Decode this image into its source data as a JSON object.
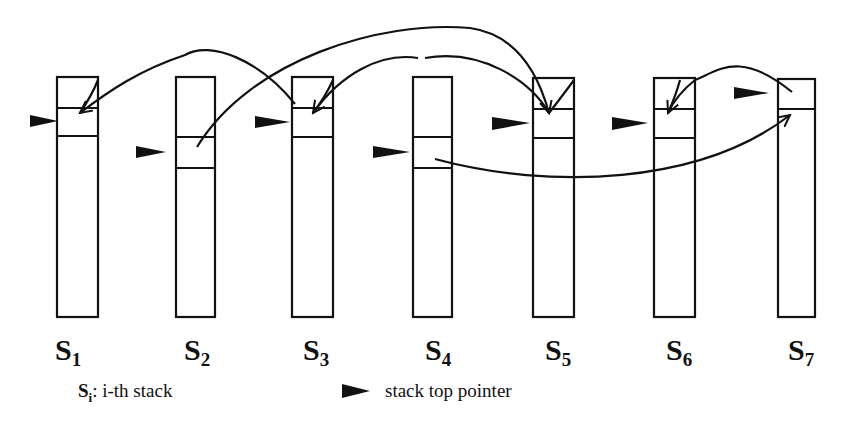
{
  "stacks": [
    {
      "name": "S",
      "index": "1"
    },
    {
      "name": "S",
      "index": "2"
    },
    {
      "name": "S",
      "index": "3"
    },
    {
      "name": "S",
      "index": "4"
    },
    {
      "name": "S",
      "index": "5"
    },
    {
      "name": "S",
      "index": "6"
    },
    {
      "name": "S",
      "index": "7"
    }
  ],
  "legend": {
    "stack_symbol": "S",
    "stack_symbol_index": "i",
    "stack_text": ": i-th stack",
    "pointer_text": "stack top pointer"
  },
  "colors": {
    "stroke": "#111111",
    "background": "#ffffff"
  }
}
